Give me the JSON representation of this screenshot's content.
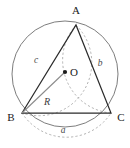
{
  "figure": {
    "canvas": {
      "width": 130,
      "height": 148,
      "background": "#ffffff"
    },
    "colors": {
      "circle_stroke": "#6e6e6e",
      "triangle_stroke": "#2b2b2b",
      "arc_dashed_stroke": "#9a9a9a",
      "radius_stroke": "#8a8a8a",
      "center_dot": "#1a1a1a",
      "label_dark": "#1a1a1a",
      "label_gray": "#4a4a4a"
    },
    "circle": {
      "name": "circumcircle",
      "center_x": 65,
      "center_y": 74,
      "radius": 53,
      "stroke_width": 0.9,
      "dashed": false
    },
    "center_point": {
      "label": "O",
      "x": 65,
      "y": 72,
      "dot_radius": 2.1,
      "label_offset_x": 5,
      "label_offset_y": 4
    },
    "vertices": [
      {
        "key": "A",
        "label": "A",
        "x": 76,
        "y": 25,
        "label_x": 76,
        "label_y": 13,
        "anchor": "middle"
      },
      {
        "key": "B",
        "label": "B",
        "x": 22,
        "y": 113,
        "label_x": 12,
        "label_y": 120,
        "anchor": "middle"
      },
      {
        "key": "C",
        "label": "C",
        "x": 111,
        "y": 113,
        "label_x": 121,
        "label_y": 120,
        "anchor": "middle"
      }
    ],
    "sides": [
      {
        "key": "a",
        "label": "a",
        "between": "B-C",
        "label_x": 63,
        "label_y": 132,
        "arc_bulge": "outward-down",
        "chord": {
          "x1": 22,
          "y1": 113,
          "x2": 111,
          "y2": 113
        },
        "arc_sweep": 0,
        "arc_radius": 53
      },
      {
        "key": "b",
        "label": "b",
        "between": "A-C",
        "label_x": 100,
        "label_y": 64,
        "arc_bulge": "outward-right",
        "chord": {
          "x1": 76,
          "y1": 25,
          "x2": 111,
          "y2": 113
        },
        "arc_sweep": 0,
        "arc_radius": 53
      },
      {
        "key": "c",
        "label": "c",
        "between": "A-B",
        "label_x": 36,
        "label_y": 61,
        "arc_bulge": "outward-left",
        "chord": {
          "x1": 76,
          "y1": 25,
          "x2": 22,
          "y2": 113
        },
        "arc_sweep": 1,
        "arc_radius": 53
      }
    ],
    "radius_segment": {
      "key": "R",
      "label": "R",
      "from": "B",
      "to": "O",
      "x1": 22,
      "y1": 113,
      "x2": 65,
      "y2": 72,
      "label_x": 48,
      "label_y": 103
    },
    "dash_pattern": "2.2,2.2"
  }
}
